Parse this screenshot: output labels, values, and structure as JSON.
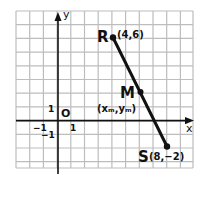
{
  "diagram": {
    "axes": {
      "x_label": "x",
      "y_label": "y",
      "origin_label": "O",
      "tick_x_pos": "1",
      "tick_x_neg": "−1",
      "tick_y_pos": "1",
      "tick_y_neg": "−1"
    },
    "points": [
      {
        "name": "R",
        "coords_label": "(4,6)",
        "x": 4,
        "y": 6
      },
      {
        "name": "M",
        "coords_label": "(xₘ,yₘ)",
        "x": 6,
        "y": 2
      },
      {
        "name": "S",
        "coords_label": "(8,−2)",
        "x": 8,
        "y": -2
      }
    ],
    "segment": {
      "from": "R",
      "to": "S"
    },
    "grid": {
      "xmin": -3,
      "xmax": 10,
      "ymin": -5,
      "ymax": 8
    },
    "colors": {
      "grid": "#b8b8b8",
      "ink": "#111111"
    }
  }
}
